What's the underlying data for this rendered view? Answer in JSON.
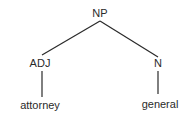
{
  "tree": {
    "root": {
      "label": "NP"
    },
    "left": {
      "label": "ADJ",
      "word": "attorney"
    },
    "right": {
      "label": "N",
      "word": "general"
    }
  },
  "colors": {
    "line": "#2a2a2a",
    "text": "#2a2a2a",
    "background": "#ffffff"
  }
}
